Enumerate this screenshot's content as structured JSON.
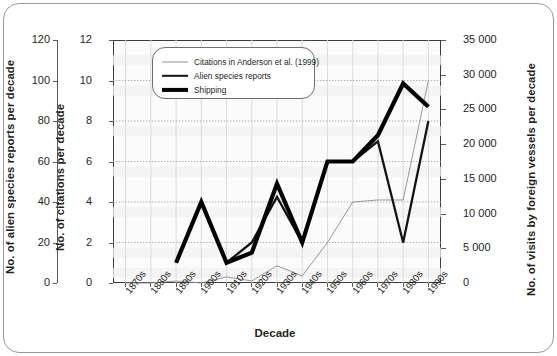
{
  "figure": {
    "x_axis_title": "Decade"
  },
  "axes": {
    "left_outer": {
      "title": "No. of alien species reports per decade",
      "ticks": [
        "120",
        "100",
        "80",
        "60",
        "40",
        "20",
        "0"
      ]
    },
    "left_inner": {
      "title": "No. of citations per decade",
      "ticks": [
        "12",
        "10",
        "8",
        "6",
        "4",
        "2",
        "0"
      ]
    },
    "right": {
      "title": "No. of visits by foreign vessels per decade",
      "ticks": [
        "35 000",
        "30 000",
        "25 000",
        "20 000",
        "15 000",
        "10 000",
        "5 000",
        "0"
      ]
    }
  },
  "legend": {
    "items": [
      {
        "label": "Citations in Anderson et al. (1999)",
        "style": "thin",
        "color": "#8d8d90"
      },
      {
        "label": "Alien species reports",
        "style": "medium",
        "color": "#131313"
      },
      {
        "label": "Shipping",
        "style": "thick",
        "color": "#000000"
      }
    ]
  },
  "chart_data": {
    "type": "line",
    "title": "",
    "xlabel": "Decade",
    "ylabel": "No. of citations per decade",
    "grid": true,
    "legend_position": "top-center",
    "categories": [
      "1870s",
      "1880s",
      "1890s",
      "1900s",
      "1910s",
      "1920s",
      "1930s",
      "1940s",
      "1950s",
      "1960s",
      "1970s",
      "1980s",
      "1990s"
    ],
    "axis_left_outer": {
      "label": "No. of alien species reports per decade",
      "ylim": [
        0,
        120
      ],
      "ticks": [
        0,
        20,
        40,
        60,
        80,
        100,
        120
      ]
    },
    "axis_left_inner": {
      "label": "No. of citations per decade",
      "ylim": [
        0,
        12
      ],
      "ticks": [
        0,
        2,
        4,
        6,
        8,
        10,
        12
      ]
    },
    "axis_right": {
      "label": "No. of visits by foreign vessels per decade",
      "ylim": [
        0,
        35000
      ],
      "ticks": [
        0,
        5000,
        10000,
        15000,
        20000,
        25000,
        30000,
        35000
      ]
    },
    "series": [
      {
        "name": "Citations in Anderson et al. (1999)",
        "axis": "left_inner",
        "style": "thin",
        "color": "#8d8d90",
        "values": [
          0,
          0,
          0.1,
          0,
          0.3,
          0.1,
          0.85,
          0.35,
          2.0,
          4.0,
          4.1,
          4.1,
          10.0
        ]
      },
      {
        "name": "Alien species reports",
        "axis": "left_outer",
        "style": "medium",
        "color": "#131313",
        "values": [
          null,
          null,
          1.0,
          4.0,
          1.0,
          2.0,
          4.25,
          2.0,
          6.0,
          6.0,
          7.0,
          2.0,
          8.0
        ]
      },
      {
        "name": "Shipping",
        "axis": "right",
        "style": "thick",
        "color": "#000000",
        "values": [
          null,
          null,
          1.0,
          4.0,
          1.0,
          1.5,
          4.9,
          2.0,
          6.0,
          6.0,
          7.3,
          9.85,
          8.7
        ]
      }
    ]
  }
}
